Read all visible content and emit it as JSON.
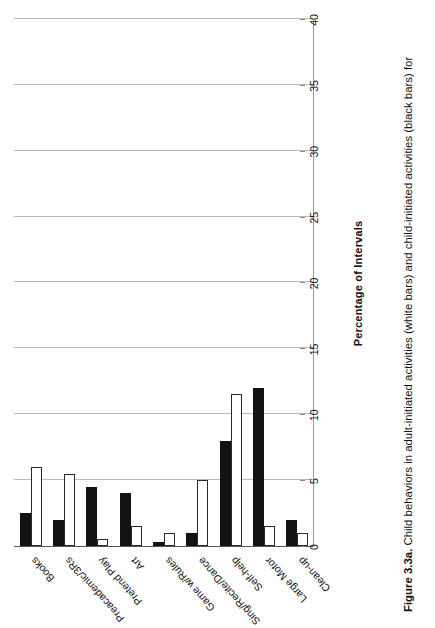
{
  "figure": {
    "label": "Figure 3.3a.",
    "caption": "Child behaviors in adult-initiated activities (white bars) and child-initiated activities (black bars) for"
  },
  "chart_data": {
    "type": "bar",
    "orientation": "horizontal",
    "title": "",
    "xlabel": "",
    "ylabel": "Percentage of Intervals",
    "value_axis_title": "Percentage of Intervals",
    "ylim": [
      0,
      40
    ],
    "ticks": [
      "0",
      "5",
      "10",
      "15",
      "20",
      "25",
      "30",
      "35",
      "40"
    ],
    "tick_values": [
      0,
      5,
      10,
      15,
      20,
      25,
      30,
      35,
      40
    ],
    "grid": true,
    "legend": "none",
    "categories": [
      "Books",
      "Preacademic/3Rs",
      "Pretend Play",
      "Art",
      "Game w/Rules",
      "Sing/Recite/Dance",
      "Self-help",
      "Large Motor",
      "Clean-up"
    ],
    "series": [
      {
        "name": "adult-initiated activities",
        "style": "white bars",
        "color": "#ffffff",
        "values": [
          6.0,
          5.5,
          0.5,
          1.5,
          1.0,
          5.0,
          11.5,
          1.5,
          1.0
        ]
      },
      {
        "name": "child-initiated activities",
        "style": "black bars",
        "color": "#121212",
        "values": [
          2.5,
          2.0,
          4.5,
          4.0,
          0.3,
          1.0,
          8.0,
          12.0,
          2.0
        ]
      }
    ]
  }
}
